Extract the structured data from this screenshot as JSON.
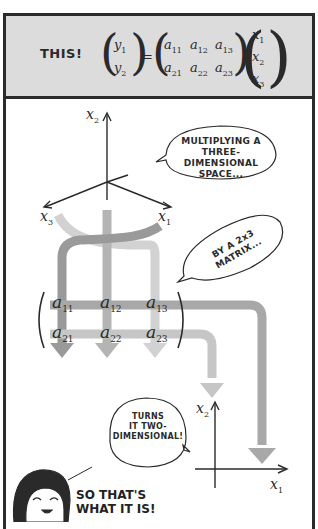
{
  "top_panel": {
    "label": "THIS!",
    "equation": {
      "lhs": [
        "y1",
        "y2"
      ],
      "matrix": [
        [
          "a11",
          "a12",
          "a13"
        ],
        [
          "a21",
          "a22",
          "a23"
        ]
      ],
      "rhs": [
        "x1",
        "x2",
        "x3"
      ]
    }
  },
  "bottom_panel": {
    "axes3d": {
      "labels": [
        "x2",
        "x3",
        "x1"
      ]
    },
    "bubbles": [
      {
        "id": "multiplying",
        "lines": [
          "MULTIPLYING A",
          "THREE-DIMENSIONAL",
          "SPACE..."
        ]
      },
      {
        "id": "by-matrix",
        "lines": [
          "BY A 2x3",
          "MATRIX..."
        ]
      },
      {
        "id": "turns",
        "lines": [
          "TURNS",
          "IT TWO-",
          "DIMENSIONAL!"
        ]
      }
    ],
    "matrix": [
      [
        "a11",
        "a12",
        "a13"
      ],
      [
        "a21",
        "a22",
        "a23"
      ]
    ],
    "axes2d": {
      "labels": [
        "x2",
        "x1"
      ]
    },
    "character_line": [
      "SO THAT'S",
      "WHAT IT IS!"
    ]
  },
  "colors": {
    "top_bg": "#dcdcdc",
    "border": "#2b2b2b",
    "arrow_dark": "#9a9a9a",
    "arrow_mid": "#b4b4b4",
    "arrow_light": "#d2d2d2"
  }
}
